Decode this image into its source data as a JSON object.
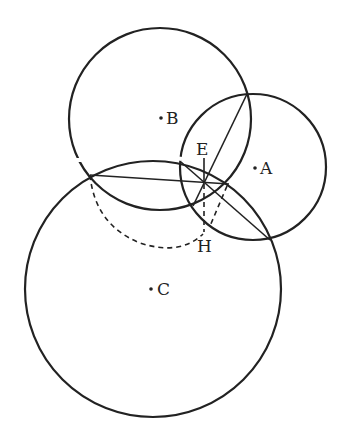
{
  "diagram": {
    "type": "geometry",
    "labels": {
      "A": "A",
      "B": "B",
      "C": "C",
      "E": "E",
      "H": "H"
    },
    "circles": [
      {
        "name": "circle-B",
        "cx": 160,
        "cy": 119,
        "r": 91
      },
      {
        "name": "circle-A",
        "cx": 253,
        "cy": 167,
        "r": 73
      },
      {
        "name": "circle-C",
        "cx": 153,
        "cy": 289,
        "r": 128
      }
    ],
    "stroke_color": "#222222"
  }
}
